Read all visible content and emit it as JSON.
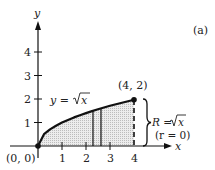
{
  "figure": {
    "panel_label": "(a)",
    "axes": {
      "x_label": "x",
      "y_label": "y",
      "x_ticks": [
        "1",
        "2",
        "3",
        "4"
      ],
      "y_ticks": [
        "1",
        "2",
        "3",
        "4"
      ]
    },
    "curve_label_prefix": "y = ",
    "curve_label_sqrt": "x",
    "origin_label": "(0, 0)",
    "endpoint_label": "(4, 2)",
    "radius_label_prefix": "R = ",
    "radius_label_sqrt": "x",
    "inner_radius_label": "(r = 0)",
    "colors": {
      "stroke": "#111111",
      "shade": "#d9d9d9"
    }
  }
}
